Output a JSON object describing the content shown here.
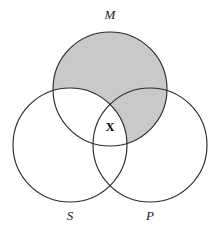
{
  "diagram": {
    "kind": "venn-diagram",
    "title": "",
    "background_color": "#ffffff",
    "stroke_color": "#2b2b2b",
    "shade_color": "#c9c9c9",
    "label_color": "#1a1a1a",
    "circles": [
      {
        "id": "M",
        "label": "M",
        "cx": 110,
        "cy": 89,
        "r": 57,
        "label_x": 110,
        "label_y": 16
      },
      {
        "id": "S",
        "label": "S",
        "cx": 70,
        "cy": 145,
        "r": 57,
        "label_x": 70,
        "label_y": 217
      },
      {
        "id": "P",
        "label": "P",
        "cx": 150,
        "cy": 145,
        "r": 57,
        "label_x": 150,
        "label_y": 217
      }
    ],
    "shaded_regions": [
      {
        "id": "M-minus-S",
        "description": "M excluding S",
        "color": "#c9c9c9"
      }
    ],
    "marks": [
      {
        "id": "x-mark",
        "text": "X",
        "x": 110,
        "y": 128,
        "region": "S-and-M-and-P"
      }
    ]
  }
}
